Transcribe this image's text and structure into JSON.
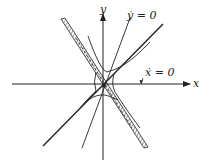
{
  "diagram": {
    "type": "phase-portrait",
    "axes": {
      "x_label": "x",
      "y_label": "y"
    },
    "nullclines": {
      "ydot": "ẏ = 0",
      "xdot": "ẋ = 0"
    },
    "colors": {
      "ink": "#222222",
      "background": "#ffffff"
    }
  }
}
